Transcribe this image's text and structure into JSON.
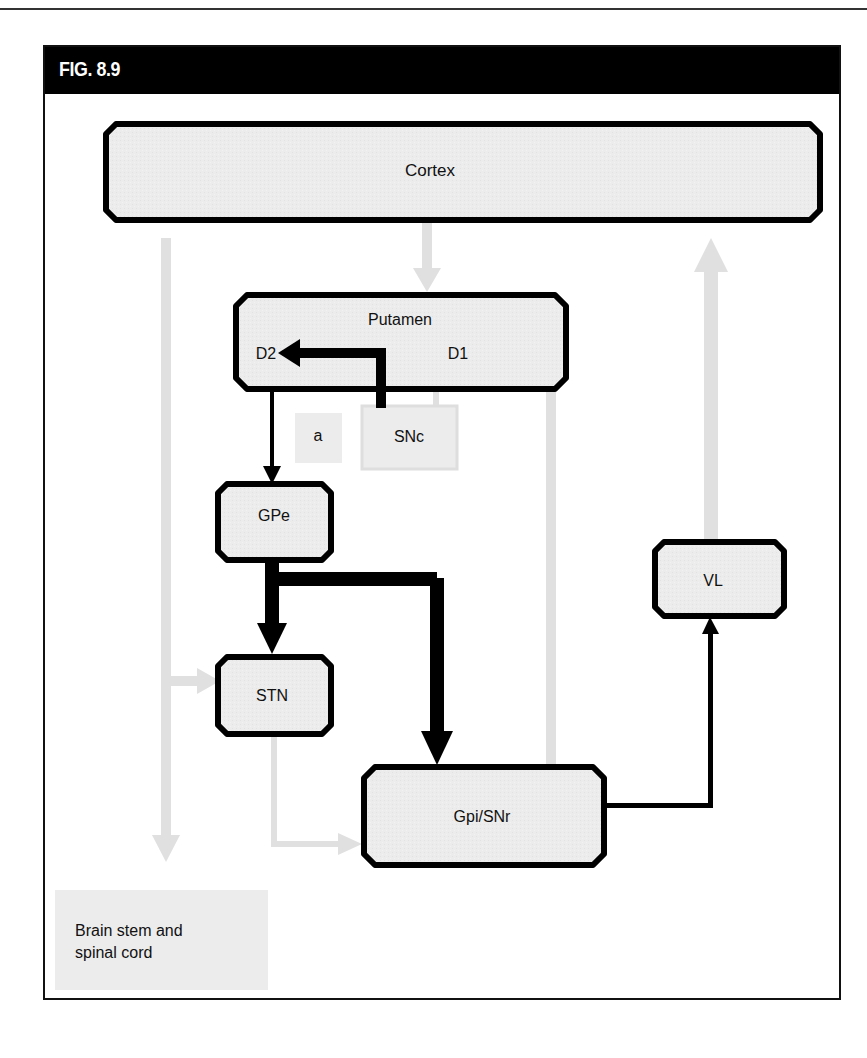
{
  "figure": {
    "title": "FIG. 8.9"
  },
  "nodes": {
    "cortex": "Cortex",
    "putamen": "Putamen",
    "d2": "D2",
    "d1": "D1",
    "a": "a",
    "snc": "SNc",
    "gpe": "GPe",
    "stn": "STN",
    "gpi_snr": "Gpi/SNr",
    "vl": "VL",
    "brainstem_line1": "Brain stem and",
    "brainstem_line2": "spinal cord"
  },
  "colors": {
    "active_pathway": "#000000",
    "inactive_pathway": "#e2e2e2",
    "box_fill": "#eeeeee",
    "header": "#000000"
  },
  "edges": [
    {
      "from": "Cortex",
      "to": "Putamen",
      "style": "inactive"
    },
    {
      "from": "Cortex",
      "to": "Brain stem and spinal cord",
      "style": "inactive"
    },
    {
      "from": "Cortex",
      "to": "STN",
      "style": "inactive"
    },
    {
      "from": "SNc",
      "to": "D2",
      "style": "active-thick"
    },
    {
      "from": "SNc",
      "to": "D1",
      "style": "inactive"
    },
    {
      "from": "Putamen",
      "to": "GPe",
      "style": "active"
    },
    {
      "from": "Putamen",
      "to": "Gpi/SNr",
      "style": "inactive"
    },
    {
      "from": "GPe",
      "to": "STN",
      "style": "active-thick"
    },
    {
      "from": "GPe",
      "to": "Gpi/SNr",
      "style": "active-thick"
    },
    {
      "from": "STN",
      "to": "Gpi/SNr",
      "style": "inactive"
    },
    {
      "from": "Gpi/SNr",
      "to": "VL",
      "style": "active"
    },
    {
      "from": "VL",
      "to": "Cortex",
      "style": "inactive"
    }
  ]
}
